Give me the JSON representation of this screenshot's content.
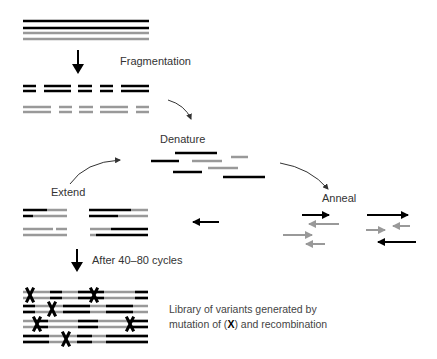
{
  "labels": {
    "fragmentation": "Fragmentation",
    "denature": "Denature",
    "anneal": "Anneal",
    "extend": "Extend",
    "after_cycles": "After 40–80 cycles",
    "library_line1": "Library of variants generated by",
    "library_line2_pre": "mutation of (",
    "library_mutation_symbol": "X",
    "library_line2_post": ") and recombination"
  },
  "colors": {
    "strand_dark": "#000000",
    "strand_light": "#999999",
    "text": "#333333"
  }
}
